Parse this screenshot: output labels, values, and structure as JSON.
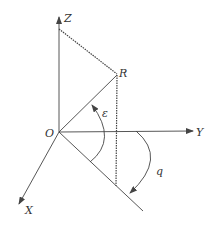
{
  "diagram": {
    "labels": {
      "origin": "O",
      "x_axis": "X",
      "y_axis": "Y",
      "z_axis": "Z",
      "point": "R",
      "elevation_angle": "ε",
      "azimuth_angle": "q"
    },
    "colors": {
      "line": "#444444",
      "dashed": "#444444",
      "background": "#ffffff"
    }
  }
}
